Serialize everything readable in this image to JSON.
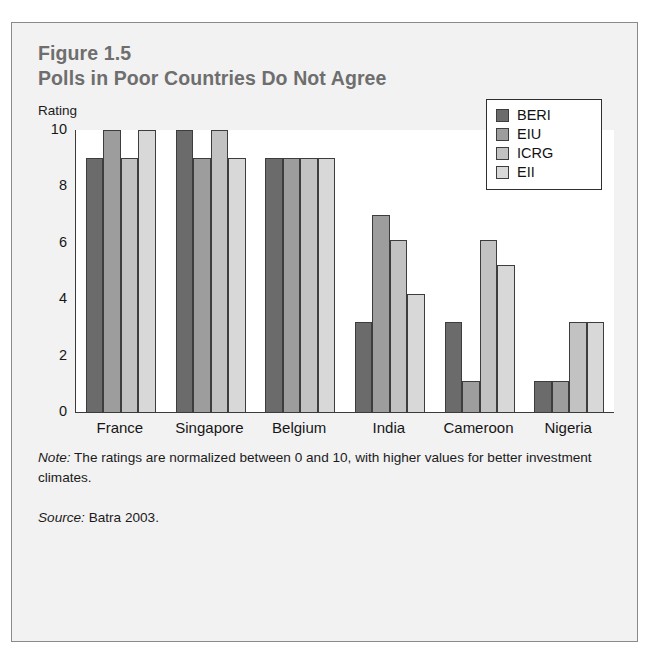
{
  "figure": {
    "label": "Figure 1.5",
    "title": "Polls in Poor Countries Do Not Agree",
    "axis_caption": "Rating",
    "note_keyword": "Note:",
    "note_text": " The ratings are normalized between 0 and 10, with higher values for better investment climates.",
    "source_keyword": "Source:",
    "source_text": " Batra 2003."
  },
  "colors": {
    "series_beri": "#6b6b6b",
    "series_eiu": "#9d9d9d",
    "series_icrg": "#c2c2c2",
    "series_eii": "#d8d8d8",
    "bar_outline": "#3d3d3d",
    "axis": "#3b3b3b",
    "panel_background": "#f2f2f2",
    "plot_background": "#ffffff",
    "title_text": "#6e6e6e",
    "body_text": "#1b1b1b"
  },
  "chart_data": {
    "type": "bar",
    "title": "Polls in Poor Countries Do Not Agree",
    "subtitle": "Figure 1.5",
    "xlabel": "",
    "ylabel": "Rating",
    "ylim": [
      0,
      10
    ],
    "yticks": [
      0,
      2,
      4,
      6,
      8,
      10
    ],
    "ytick_labels": [
      "0",
      "2",
      "4",
      "6",
      "8",
      "10"
    ],
    "grid": false,
    "legend_position": "top-right",
    "categories": [
      "France",
      "Singapore",
      "Belgium",
      "India",
      "Cameroon",
      "Nigeria"
    ],
    "series": [
      {
        "name": "BERI",
        "color": "#6b6b6b",
        "values": [
          9.0,
          10.0,
          9.0,
          3.2,
          3.2,
          1.1
        ]
      },
      {
        "name": "EIU",
        "color": "#9d9d9d",
        "values": [
          10.0,
          9.0,
          9.0,
          7.0,
          1.1,
          1.1
        ]
      },
      {
        "name": "ICRG",
        "color": "#c2c2c2",
        "values": [
          9.0,
          10.0,
          9.0,
          6.1,
          6.1,
          3.2
        ]
      },
      {
        "name": "EII",
        "color": "#d8d8d8",
        "values": [
          10.0,
          9.0,
          9.0,
          4.2,
          5.2,
          3.2
        ]
      }
    ]
  }
}
